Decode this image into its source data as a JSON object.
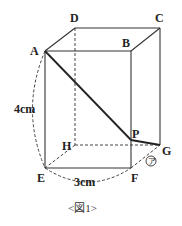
{
  "figure": {
    "caption": "<図1>",
    "vertices": {
      "A": "A",
      "B": "B",
      "C": "C",
      "D": "D",
      "E": "E",
      "F": "F",
      "G": "G",
      "H": "H",
      "P": "P"
    },
    "dimensions": {
      "height": "4cm",
      "width": "3cm"
    },
    "angle_mark": "㋐"
  }
}
